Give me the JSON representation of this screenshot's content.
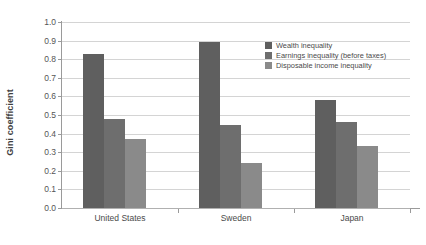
{
  "chart_data": {
    "type": "bar",
    "title": "",
    "xlabel": "",
    "ylabel": "Gini coefficient",
    "categories": [
      "United States",
      "Sweden",
      "Japan"
    ],
    "series": [
      {
        "name": "Wealth inequality",
        "color": "#5f5f5f",
        "values": [
          0.83,
          0.89,
          0.58
        ]
      },
      {
        "name": "Earnings inequality (before taxes)",
        "color": "#6e6e6e",
        "values": [
          0.48,
          0.445,
          0.465
        ]
      },
      {
        "name": "Disposable income inequality",
        "color": "#8a8a8a",
        "values": [
          0.37,
          0.24,
          0.335
        ]
      }
    ],
    "ylim": [
      0.0,
      1.0
    ],
    "ytick_step": 0.1,
    "yticks": [
      "1.0",
      "0.9",
      "0.8",
      "0.7",
      "0.6",
      "0.5",
      "0.4",
      "0.3",
      "0.2",
      "0.1",
      "0.0"
    ],
    "grid": true,
    "grid_axis": "y",
    "legend_position": "upper right inside",
    "background_color": "#ffffff",
    "gridline_color": "#d4d4d4",
    "axis_color": "#9a9a9a"
  }
}
